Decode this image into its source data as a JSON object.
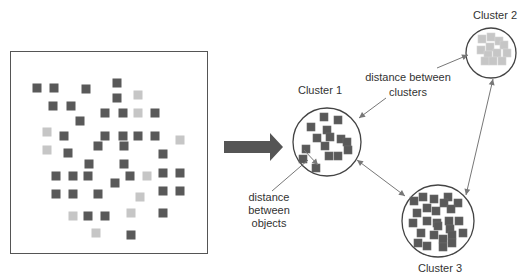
{
  "colors": {
    "dark_object": "#595959",
    "light_object": "#c6c6c6",
    "outline": "#444444",
    "connector": "#777777",
    "big_arrow": "#555555",
    "text": "#333333"
  },
  "raw_data_box": {
    "x": 10,
    "y": 51,
    "width": 198,
    "height": 203,
    "square_size": 9,
    "objects": [
      {
        "x": 37,
        "y": 88,
        "c": "dark"
      },
      {
        "x": 54,
        "y": 88,
        "c": "dark"
      },
      {
        "x": 86,
        "y": 89,
        "c": "dark"
      },
      {
        "x": 117,
        "y": 83,
        "c": "dark"
      },
      {
        "x": 117,
        "y": 98,
        "c": "dark"
      },
      {
        "x": 138,
        "y": 95,
        "c": "light"
      },
      {
        "x": 53,
        "y": 106,
        "c": "dark"
      },
      {
        "x": 71,
        "y": 106,
        "c": "dark"
      },
      {
        "x": 105,
        "y": 113,
        "c": "dark"
      },
      {
        "x": 123,
        "y": 113,
        "c": "dark"
      },
      {
        "x": 138,
        "y": 113,
        "c": "light"
      },
      {
        "x": 155,
        "y": 113,
        "c": "dark"
      },
      {
        "x": 80,
        "y": 121,
        "c": "dark"
      },
      {
        "x": 47,
        "y": 132,
        "c": "light"
      },
      {
        "x": 64,
        "y": 136,
        "c": "dark"
      },
      {
        "x": 105,
        "y": 136,
        "c": "dark"
      },
      {
        "x": 123,
        "y": 136,
        "c": "dark"
      },
      {
        "x": 138,
        "y": 136,
        "c": "dark"
      },
      {
        "x": 155,
        "y": 136,
        "c": "dark"
      },
      {
        "x": 180,
        "y": 140,
        "c": "light"
      },
      {
        "x": 47,
        "y": 150,
        "c": "light"
      },
      {
        "x": 68,
        "y": 153,
        "c": "dark"
      },
      {
        "x": 98,
        "y": 146,
        "c": "dark"
      },
      {
        "x": 124,
        "y": 146,
        "c": "dark"
      },
      {
        "x": 163,
        "y": 154,
        "c": "dark"
      },
      {
        "x": 89,
        "y": 164,
        "c": "dark"
      },
      {
        "x": 124,
        "y": 164,
        "c": "dark"
      },
      {
        "x": 56,
        "y": 176,
        "c": "dark"
      },
      {
        "x": 73,
        "y": 176,
        "c": "dark"
      },
      {
        "x": 88,
        "y": 176,
        "c": "dark"
      },
      {
        "x": 130,
        "y": 176,
        "c": "dark"
      },
      {
        "x": 147,
        "y": 176,
        "c": "light"
      },
      {
        "x": 163,
        "y": 173,
        "c": "dark"
      },
      {
        "x": 180,
        "y": 173,
        "c": "dark"
      },
      {
        "x": 115,
        "y": 183,
        "c": "dark"
      },
      {
        "x": 56,
        "y": 194,
        "c": "dark"
      },
      {
        "x": 73,
        "y": 194,
        "c": "dark"
      },
      {
        "x": 98,
        "y": 194,
        "c": "dark"
      },
      {
        "x": 140,
        "y": 197,
        "c": "light"
      },
      {
        "x": 163,
        "y": 191,
        "c": "dark"
      },
      {
        "x": 180,
        "y": 191,
        "c": "dark"
      },
      {
        "x": 73,
        "y": 216,
        "c": "light"
      },
      {
        "x": 88,
        "y": 216,
        "c": "dark"
      },
      {
        "x": 105,
        "y": 216,
        "c": "dark"
      },
      {
        "x": 131,
        "y": 213,
        "c": "light"
      },
      {
        "x": 163,
        "y": 213,
        "c": "dark"
      },
      {
        "x": 96,
        "y": 233,
        "c": "light"
      },
      {
        "x": 131,
        "y": 235,
        "c": "dark"
      }
    ]
  },
  "transform_arrow": {
    "x1": 224,
    "x2": 283,
    "cy": 147,
    "body_half": 6,
    "head_half": 14,
    "head_len": 13
  },
  "clusters": [
    {
      "label": "Cluster 1",
      "label_x": 320,
      "label_y": 84,
      "cx": 327,
      "cy": 142,
      "r": 34,
      "square_size": 8,
      "color": "dark",
      "objects": [
        [
          321,
          114
        ],
        [
          335,
          117
        ],
        [
          308,
          124
        ],
        [
          324,
          127
        ],
        [
          314,
          135
        ],
        [
          327,
          134
        ],
        [
          338,
          136
        ],
        [
          344,
          139
        ],
        [
          322,
          143
        ],
        [
          345,
          147
        ],
        [
          303,
          146
        ],
        [
          300,
          156
        ],
        [
          326,
          153
        ],
        [
          335,
          153
        ],
        [
          313,
          165
        ]
      ]
    },
    {
      "label": "Cluster 2",
      "label_x": 495,
      "label_y": 9,
      "cx": 491,
      "cy": 53,
      "r": 25,
      "square_size": 8,
      "color": "light",
      "objects": [
        [
          479,
          36
        ],
        [
          488,
          34
        ],
        [
          496,
          38
        ],
        [
          501,
          42
        ],
        [
          478,
          47
        ],
        [
          487,
          44
        ],
        [
          485,
          52
        ],
        [
          494,
          50
        ],
        [
          504,
          50
        ],
        [
          482,
          58
        ],
        [
          490,
          58
        ],
        [
          499,
          58
        ]
      ]
    },
    {
      "label": "Cluster 3",
      "label_x": 440,
      "label_y": 262,
      "cx": 438,
      "cy": 221,
      "r": 36,
      "square_size": 8,
      "color": "dark",
      "objects": [
        [
          411,
          198
        ],
        [
          420,
          194
        ],
        [
          431,
          196
        ],
        [
          445,
          194
        ],
        [
          455,
          200
        ],
        [
          441,
          200
        ],
        [
          414,
          210
        ],
        [
          424,
          205
        ],
        [
          433,
          208
        ],
        [
          448,
          206
        ],
        [
          424,
          218
        ],
        [
          410,
          220
        ],
        [
          434,
          220
        ],
        [
          446,
          218
        ],
        [
          456,
          218
        ],
        [
          418,
          230
        ],
        [
          435,
          223
        ],
        [
          447,
          226
        ],
        [
          460,
          230
        ],
        [
          415,
          240
        ],
        [
          431,
          232
        ],
        [
          440,
          236
        ],
        [
          449,
          232
        ],
        [
          424,
          243
        ],
        [
          440,
          244
        ],
        [
          449,
          240
        ]
      ]
    }
  ],
  "annotations": {
    "between_clusters": {
      "line1": "distance between",
      "line2": "clusters",
      "x": 408,
      "y": 70
    },
    "between_objects": {
      "line1": "distance",
      "line2": "between",
      "line3": "objects",
      "x": 269,
      "y": 191
    }
  },
  "connectors": [
    {
      "name": "cluster2-pointer",
      "x1": 437,
      "y1": 68,
      "x2": 468,
      "y2": 55,
      "head_end": true,
      "head_start": false
    },
    {
      "name": "cluster1-pointer",
      "x1": 386,
      "y1": 98,
      "x2": 359,
      "y2": 118,
      "head_end": true,
      "head_start": false
    },
    {
      "name": "objects-pointer",
      "x1": 272,
      "y1": 191,
      "x2": 308,
      "y2": 160,
      "head_end": false,
      "head_start": false
    },
    {
      "name": "object-distance",
      "x1": 304,
      "y1": 150,
      "x2": 318,
      "y2": 165,
      "head_end": true,
      "head_start": false
    },
    {
      "name": "cluster1-cluster3-distance",
      "x1": 357,
      "y1": 160,
      "x2": 405,
      "y2": 196,
      "head_end": true,
      "head_start": true
    },
    {
      "name": "cluster2-cluster3-distance",
      "x1": 493,
      "y1": 79,
      "x2": 466,
      "y2": 195,
      "head_end": true,
      "head_start": true
    }
  ]
}
